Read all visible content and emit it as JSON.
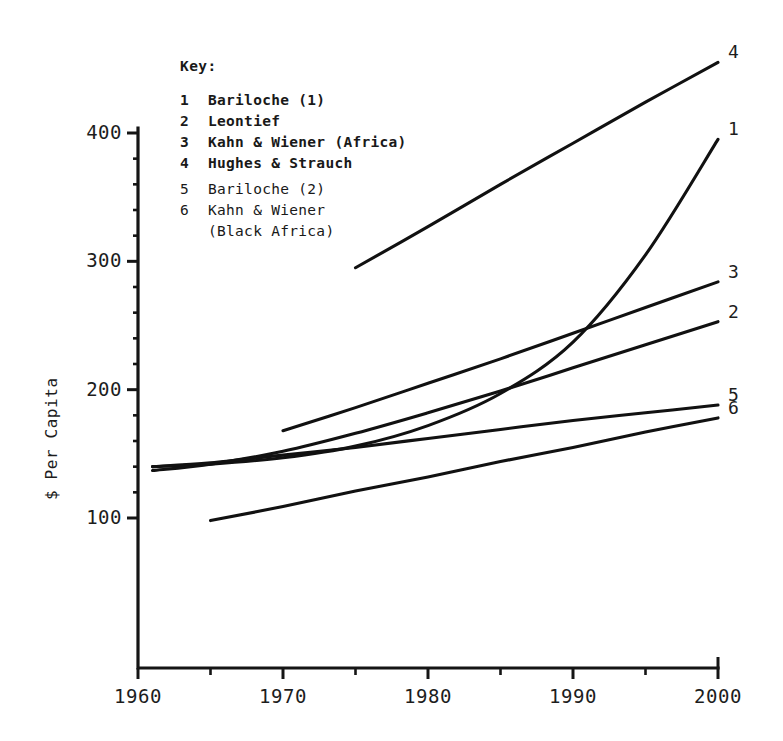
{
  "legend": {
    "title": "Key:",
    "entries": [
      {
        "key": "1",
        "label": "Bariloche (1)",
        "bold": true
      },
      {
        "key": "2",
        "label": "Leontief",
        "bold": true
      },
      {
        "key": "3",
        "label": "Kahn & Wiener (Africa)",
        "bold": true
      },
      {
        "key": "4",
        "label": "Hughes & Strauch",
        "bold": true
      },
      {
        "key": "5",
        "label": "Bariloche (2)",
        "bold": false
      },
      {
        "key": "6",
        "label": "Kahn & Wiener",
        "bold": false
      }
    ],
    "continuation": "(Black Africa)"
  },
  "axes": {
    "ylabel": "$ Per Capita",
    "ytick_labels": [
      "400",
      "300",
      "200",
      "100"
    ],
    "ytick_values": [
      400,
      300,
      200,
      100
    ],
    "xtick_labels": [
      "1960",
      "1970",
      "1980",
      "1990",
      "2000"
    ],
    "xtick_values": [
      1960,
      1970,
      1980,
      1990,
      2000
    ],
    "xminor_values": [
      1965,
      1975,
      1985,
      1995
    ],
    "xlim": [
      1960,
      2000
    ],
    "ylim": [
      0,
      430
    ]
  },
  "end_labels": [
    {
      "id": "4",
      "text": "4"
    },
    {
      "id": "1",
      "text": "1"
    },
    {
      "id": "3",
      "text": "3"
    },
    {
      "id": "2",
      "text": "2"
    },
    {
      "id": "5",
      "text": "5"
    },
    {
      "id": "6",
      "text": "6"
    }
  ],
  "chart_data": {
    "type": "line",
    "title": "",
    "xlabel": "",
    "ylabel": "$ Per Capita",
    "xlim": [
      1960,
      2000
    ],
    "ylim": [
      0,
      430
    ],
    "grid": false,
    "legend_position": "upper-left-inside",
    "xticks": [
      1960,
      1970,
      1980,
      1990,
      2000
    ],
    "xticks_minor": [
      1965,
      1975,
      1985,
      1995
    ],
    "yticks": [
      100,
      200,
      300,
      400
    ],
    "series": [
      {
        "name": "Bariloche (1)",
        "key": "1",
        "x": [
          1961,
          1965,
          1970,
          1975,
          1980,
          1985,
          1990,
          1995,
          2000
        ],
        "y": [
          140,
          142,
          147,
          156,
          172,
          197,
          237,
          305,
          395
        ]
      },
      {
        "name": "Leontief",
        "key": "2",
        "x": [
          1961,
          1965,
          1970,
          1975,
          1980,
          1985,
          1990,
          1995,
          2000
        ],
        "y": [
          137,
          142,
          152,
          166,
          182,
          199,
          217,
          235,
          253
        ]
      },
      {
        "name": "Kahn & Wiener (Africa)",
        "key": "3",
        "x": [
          1970,
          1975,
          1980,
          1985,
          1990,
          1995,
          2000
        ],
        "y": [
          168,
          186,
          205,
          224,
          244,
          264,
          284
        ]
      },
      {
        "name": "Hughes & Strauch",
        "key": "4",
        "x": [
          1975,
          1980,
          1985,
          1990,
          1995,
          2000
        ],
        "y": [
          295,
          327,
          360,
          392,
          424,
          455
        ]
      },
      {
        "name": "Bariloche (2)",
        "key": "5",
        "x": [
          1961,
          1965,
          1970,
          1975,
          1980,
          1985,
          1990,
          1995,
          2000
        ],
        "y": [
          140,
          143,
          149,
          155,
          162,
          169,
          176,
          182,
          188
        ]
      },
      {
        "name": "Kahn & Wiener (Black Africa)",
        "key": "6",
        "x": [
          1965,
          1970,
          1975,
          1980,
          1985,
          1990,
          1995,
          2000
        ],
        "y": [
          98,
          109,
          121,
          132,
          144,
          155,
          167,
          178
        ]
      }
    ]
  }
}
